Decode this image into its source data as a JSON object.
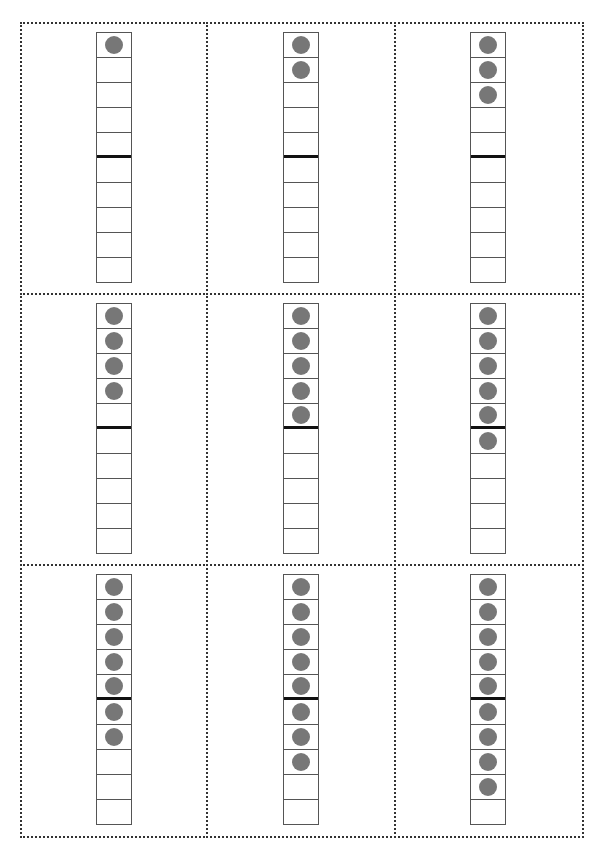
{
  "worksheet": {
    "layout": {
      "rows": 3,
      "columns": 3
    },
    "frame_cells": 10,
    "divider_after_cell": 5,
    "colors": {
      "dot": "#777777",
      "frame_border": "#555555",
      "divider": "#111111",
      "card_border": "#333333"
    },
    "cards": [
      {
        "count": 1
      },
      {
        "count": 2
      },
      {
        "count": 3
      },
      {
        "count": 4
      },
      {
        "count": 5
      },
      {
        "count": 6
      },
      {
        "count": 7
      },
      {
        "count": 8
      },
      {
        "count": 9
      }
    ]
  },
  "footer": {
    "text": ""
  }
}
